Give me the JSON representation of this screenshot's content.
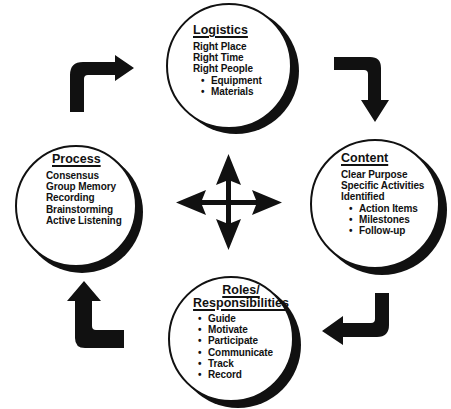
{
  "diagram": {
    "type": "cycle",
    "colors": {
      "ink": "#111111",
      "background": "#ffffff"
    },
    "center_icon": "four-way-arrow-icon",
    "nodes": {
      "logistics": {
        "title": "Logistics",
        "lines": [
          "Right Place",
          "Right Time",
          "Right People"
        ],
        "bullets": [
          "Equipment",
          "Materials"
        ]
      },
      "content": {
        "title": "Content",
        "lines": [
          "Clear Purpose",
          "Specific Activities",
          "Identified"
        ],
        "bullets": [
          "Action Items",
          "Milestones",
          "Follow-up"
        ]
      },
      "roles": {
        "title_line1": "Roles/",
        "title_line2": "Responsibilities",
        "bullets": [
          "Guide",
          "Motivate",
          "Participate",
          "Communicate",
          "Track",
          "Record"
        ]
      },
      "process": {
        "title": "Process",
        "lines": [
          "Consensus",
          "Group Memory",
          "Recording",
          "Brainstorming",
          "Active Listening"
        ]
      }
    },
    "flow": [
      {
        "from": "process",
        "to": "logistics",
        "icon": "bent-arrow-right-icon"
      },
      {
        "from": "logistics",
        "to": "content",
        "icon": "bent-arrow-down-icon"
      },
      {
        "from": "content",
        "to": "roles",
        "icon": "bent-arrow-left-icon"
      },
      {
        "from": "roles",
        "to": "process",
        "icon": "bent-arrow-up-icon"
      }
    ]
  }
}
